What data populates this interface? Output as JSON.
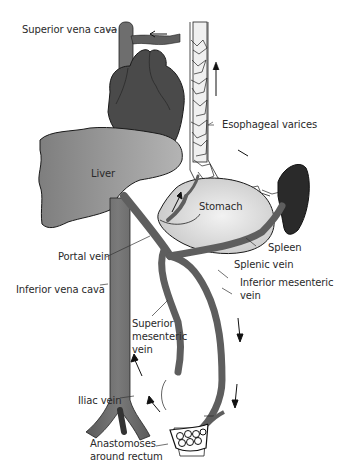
{
  "diagram": {
    "labels": {
      "superior_vena_cava": "Superior vena cava",
      "esophageal_varices": "Esophageal varices",
      "liver": "Liver",
      "stomach": "Stomach",
      "spleen": "Spleen",
      "splenic_vein": "Splenic vein",
      "portal_vein": "Portal vein",
      "inferior_mesenteric_vein_1": "Inferior mesenteric",
      "inferior_mesenteric_vein_2": "vein",
      "inferior_vena_cava": "Inferior vena cava",
      "superior_mesenteric_vein_1": "Superior",
      "superior_mesenteric_vein_2": "mesenteric",
      "superior_mesenteric_vein_3": "vein",
      "iliac_vein": "Iliac vein",
      "anastomoses_1": "Anastomoses",
      "anastomoses_2": "around rectum"
    },
    "colors": {
      "vein": "#5e5e5e",
      "heart": "#4a4a4a",
      "liver": "#8a8a8a",
      "stomach": "#e2e2e2",
      "spleen": "#2a2a2a",
      "outline": "#1a1a1a"
    }
  }
}
